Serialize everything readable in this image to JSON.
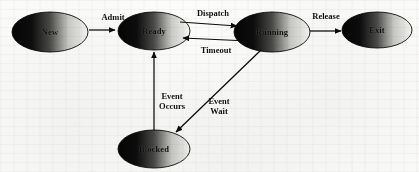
{
  "diagram": {
    "background_color": "#fcfcfb",
    "stroke_color": "#0a0a0a",
    "node_fill_dark": "#0b0b0b",
    "node_fill_light": "#f2f2f0",
    "states": [
      {
        "id": "new",
        "label": "New",
        "cx": 50,
        "cy": 32,
        "rx": 38,
        "ry": 20
      },
      {
        "id": "ready",
        "label": "Ready",
        "cx": 154,
        "cy": 31,
        "rx": 36,
        "ry": 19
      },
      {
        "id": "running",
        "label": "Running",
        "cx": 272,
        "cy": 32,
        "rx": 38,
        "ry": 20
      },
      {
        "id": "exit",
        "label": "Exit",
        "cx": 377,
        "cy": 30,
        "rx": 35,
        "ry": 18
      },
      {
        "id": "blocked",
        "label": "Blocked",
        "cx": 154,
        "cy": 149,
        "rx": 36,
        "ry": 19
      }
    ],
    "transitions": [
      {
        "id": "admit",
        "label": "Admit",
        "from": "new",
        "to": "ready",
        "label_x": 113,
        "label_y": 17
      },
      {
        "id": "dispatch",
        "label": "Dispatch",
        "from": "ready",
        "to": "running",
        "label_x": 213,
        "label_y": 13
      },
      {
        "id": "timeout",
        "label": "Timeout",
        "from": "running",
        "to": "ready",
        "label_x": 216,
        "label_y": 50
      },
      {
        "id": "release",
        "label": "Release",
        "from": "running",
        "to": "exit",
        "label_x": 326,
        "label_y": 16
      },
      {
        "id": "event-wait",
        "label": "Event\nWait",
        "from": "running",
        "to": "blocked",
        "label_x": 219,
        "label_y": 106
      },
      {
        "id": "event-occurs",
        "label": "Event\nOccurs",
        "from": "blocked",
        "to": "ready",
        "label_x": 172,
        "label_y": 101
      }
    ]
  }
}
